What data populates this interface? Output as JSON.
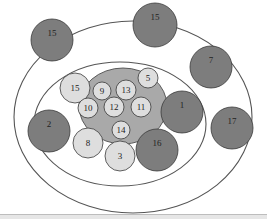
{
  "diagram": {
    "colors": {
      "dark_node": "#7d7d7d",
      "light_node": "#dedede",
      "cluster_fill": "#a9a9a9",
      "stroke": "#3a3a3a",
      "ring_stroke": "#555555"
    },
    "rings": [
      {
        "name": "outer-ring",
        "cx": 133,
        "cy": 117,
        "rx": 119,
        "ry": 96
      },
      {
        "name": "middle-ring",
        "cx": 120,
        "cy": 124,
        "rx": 86,
        "ry": 62
      }
    ],
    "cluster": {
      "name": "core-cluster",
      "cx": 123,
      "cy": 106,
      "rx": 44,
      "ry": 38
    },
    "nodes": [
      {
        "label": "15",
        "cx": 52,
        "cy": 40,
        "r": 21,
        "tone": "dark"
      },
      {
        "label": "15",
        "cx": 155,
        "cy": 25,
        "r": 22,
        "tone": "dark"
      },
      {
        "label": "7",
        "cx": 211,
        "cy": 67,
        "r": 21,
        "tone": "dark"
      },
      {
        "label": "2",
        "cx": 49,
        "cy": 131,
        "r": 21,
        "tone": "dark"
      },
      {
        "label": "1",
        "cx": 182,
        "cy": 112,
        "r": 21,
        "tone": "dark"
      },
      {
        "label": "16",
        "cx": 157,
        "cy": 150,
        "r": 21,
        "tone": "dark"
      },
      {
        "label": "17",
        "cx": 232,
        "cy": 128,
        "r": 21,
        "tone": "dark"
      },
      {
        "label": "15",
        "cx": 75,
        "cy": 88,
        "r": 15,
        "tone": "light"
      },
      {
        "label": "5",
        "cx": 148,
        "cy": 78,
        "r": 10,
        "tone": "light"
      },
      {
        "label": "9",
        "cx": 102,
        "cy": 91,
        "r": 9,
        "tone": "light"
      },
      {
        "label": "13",
        "cx": 126,
        "cy": 90,
        "r": 10,
        "tone": "light"
      },
      {
        "label": "10",
        "cx": 88,
        "cy": 108,
        "r": 10,
        "tone": "light"
      },
      {
        "label": "12",
        "cx": 114,
        "cy": 107,
        "r": 10,
        "tone": "light"
      },
      {
        "label": "11",
        "cx": 141,
        "cy": 107,
        "r": 10,
        "tone": "light"
      },
      {
        "label": "14",
        "cx": 121,
        "cy": 130,
        "r": 9,
        "tone": "light"
      },
      {
        "label": "8",
        "cx": 88,
        "cy": 143,
        "r": 15,
        "tone": "light"
      },
      {
        "label": "3",
        "cx": 120,
        "cy": 156,
        "r": 15,
        "tone": "light"
      }
    ]
  }
}
